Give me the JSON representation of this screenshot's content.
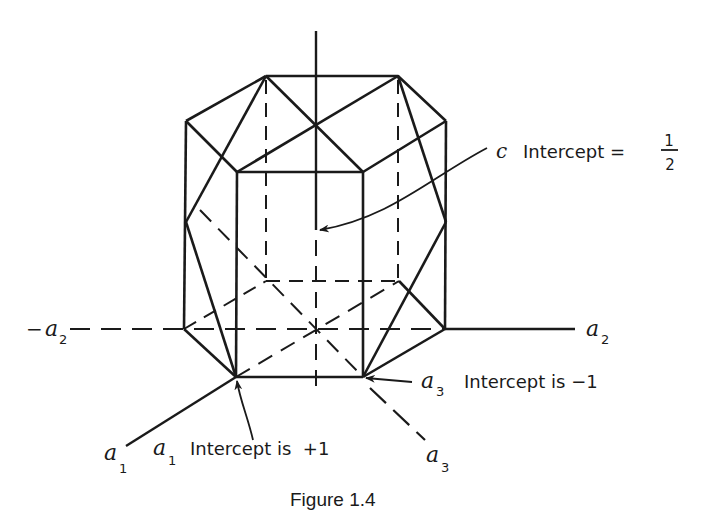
{
  "figure": {
    "caption": "Figure 1.4",
    "axes": {
      "c": "c",
      "a1": "a",
      "a1_sub": "1",
      "a2": "a",
      "a2_sub": "2",
      "neg_a2_prefix": "−",
      "neg_a2": "a",
      "neg_a2_sub": "2",
      "a3": "a",
      "a3_sub": "3"
    },
    "annotations": {
      "c_intercept": {
        "symbol": "c",
        "text": "Intercept =",
        "fraction_num": "1",
        "fraction_den": "2"
      },
      "a3_intercept": {
        "symbol": "a",
        "sub": "3",
        "text": "Intercept is −1"
      },
      "a1_intercept": {
        "symbol": "a",
        "sub": "1",
        "text": "Intercept is  +1"
      }
    },
    "colors": {
      "ink": "#1a1a1a",
      "background": "#ffffff"
    }
  }
}
